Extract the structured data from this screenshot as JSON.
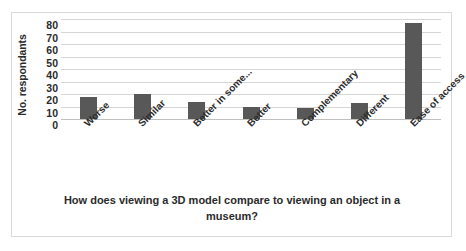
{
  "chart_data": {
    "type": "bar",
    "title": "",
    "xlabel": "How does viewing a 3D model compare to viewing an object in a museum?",
    "ylabel": "No. respondants",
    "ylim": [
      0,
      80
    ],
    "ytick_step": 10,
    "yticks": [
      80,
      70,
      60,
      50,
      40,
      30,
      20,
      10,
      0
    ],
    "grid": true,
    "legend": false,
    "categories": [
      "Worse",
      "Similar",
      "Better in some...",
      "Better",
      "Complementary",
      "Different",
      "Ease of access"
    ],
    "values": [
      18,
      20,
      14,
      10,
      9,
      13,
      77
    ],
    "series": [
      {
        "name": "No. respondants",
        "values": [
          18,
          20,
          14,
          10,
          9,
          13,
          77
        ],
        "color": "#585858"
      }
    ]
  },
  "style": {
    "bar_color": "#585858",
    "gridline_color": "#d6d6d6",
    "axis_color": "#bfbfbf",
    "border_color": "#d9d9d9",
    "text_color": "#2b2b2b",
    "background": "#ffffff"
  }
}
